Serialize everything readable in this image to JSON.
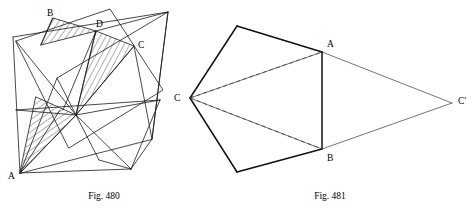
{
  "page": {
    "background_color": "#ffffff",
    "width": 472,
    "height": 208
  },
  "figures": [
    {
      "id": "fig-480",
      "caption": "Fig. 480",
      "caption_position": {
        "x": 104,
        "y": 196
      },
      "description": "Star-polygon net of a stellated solid with four hatched triangular flaps",
      "labels": [
        {
          "name": "B",
          "text": "B",
          "x": 47,
          "y": 14
        },
        {
          "name": "D",
          "text": "D",
          "x": 96,
          "y": 25
        },
        {
          "name": "C",
          "text": "C",
          "x": 138,
          "y": 46
        },
        {
          "name": "A",
          "text": "A",
          "x": 12,
          "y": 177
        }
      ],
      "colors": {
        "line": "#1a1a1a",
        "hatch": "#333333"
      }
    },
    {
      "id": "fig-481",
      "caption": "Fig. 481",
      "caption_position": {
        "x": 330,
        "y": 196
      },
      "description": "Pentagonal prism net with apex C folded outward to C prime; AB is the shared fold edge",
      "labels": [
        {
          "name": "A",
          "text": "A",
          "x": 327,
          "y": 45
        },
        {
          "name": "B",
          "text": "B",
          "x": 327,
          "y": 158
        },
        {
          "name": "C",
          "text": "C",
          "x": 176,
          "y": 99
        },
        {
          "name": "C-prime",
          "text": "C'",
          "x": 459,
          "y": 102
        }
      ],
      "colors": {
        "solid": "#111111",
        "thin": "#3a3a3a",
        "dashed": "#555555"
      }
    }
  ]
}
